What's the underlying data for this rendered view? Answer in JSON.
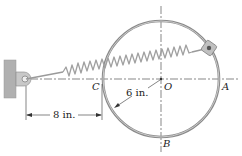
{
  "figure": {
    "type": "mechanics-diagram",
    "points": {
      "A": "A",
      "B": "B",
      "C": "C",
      "O": "O"
    },
    "dimensions": {
      "radius": "6 in.",
      "offset": "8 in."
    },
    "colors": {
      "ring": "#8a8a8a",
      "ring_inner": "#d8d8d8",
      "spring": "#9a9a9a",
      "wall": "#b0b0b0",
      "centerline": "#555555",
      "text": "#222222"
    }
  }
}
